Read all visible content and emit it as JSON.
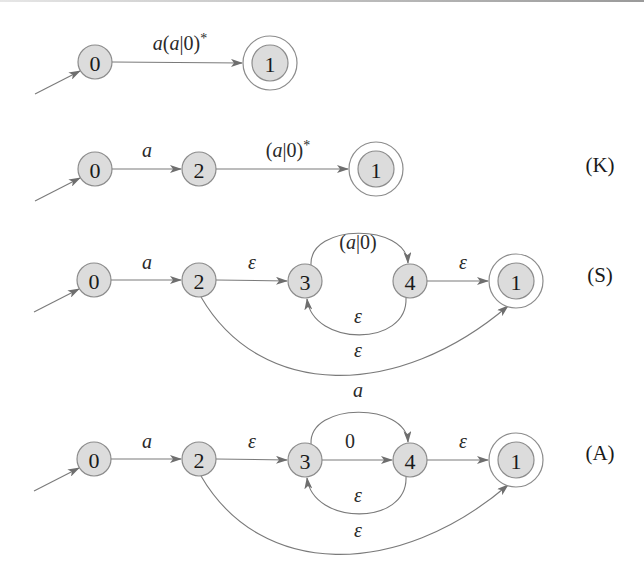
{
  "diagram": {
    "colors": {
      "node_fill": "#dcdcdc",
      "node_stroke": "#8c8c8c",
      "edge": "#7a7a7a",
      "text": "#1a1a1a"
    },
    "rows": [
      {
        "id": "row-initial",
        "tag": "",
        "nodes": [
          {
            "id": "0",
            "label": "0",
            "x": 95,
            "y": 62,
            "accepting": false,
            "initial": true
          },
          {
            "id": "1",
            "label": "1",
            "x": 270,
            "y": 63,
            "accepting": true,
            "initial": false
          }
        ],
        "edges": [
          {
            "from": "0",
            "to": "1",
            "label": "a(a|0)*",
            "label_html": [
              "a",
              "(",
              "a",
              "|0)",
              "*"
            ],
            "type": "straight",
            "lx": 180,
            "ly": 50
          }
        ]
      },
      {
        "id": "row-K",
        "tag": "(K)",
        "tag_x": 600,
        "tag_y": 165,
        "nodes": [
          {
            "id": "0",
            "label": "0",
            "x": 95,
            "y": 169,
            "accepting": false,
            "initial": true
          },
          {
            "id": "2",
            "label": "2",
            "x": 199,
            "y": 169,
            "accepting": false,
            "initial": false
          },
          {
            "id": "1",
            "label": "1",
            "x": 376,
            "y": 169,
            "accepting": true,
            "initial": false
          }
        ],
        "edges": [
          {
            "from": "0",
            "to": "2",
            "label": "a",
            "type": "straight",
            "lx": 147,
            "ly": 157
          },
          {
            "from": "2",
            "to": "1",
            "label": "(a|0)*",
            "type": "straight",
            "lx": 288,
            "ly": 157
          }
        ]
      },
      {
        "id": "row-S",
        "tag": "(S)",
        "tag_x": 600,
        "tag_y": 275,
        "nodes": [
          {
            "id": "0",
            "label": "0",
            "x": 94,
            "y": 280,
            "accepting": false,
            "initial": true
          },
          {
            "id": "2",
            "label": "2",
            "x": 199,
            "y": 280,
            "accepting": false,
            "initial": false
          },
          {
            "id": "3",
            "label": "3",
            "x": 305,
            "y": 281,
            "accepting": false,
            "initial": false
          },
          {
            "id": "4",
            "label": "4",
            "x": 410,
            "y": 281,
            "accepting": false,
            "initial": false
          },
          {
            "id": "1",
            "label": "1",
            "x": 516,
            "y": 281,
            "accepting": true,
            "initial": false
          }
        ],
        "edges": [
          {
            "from": "0",
            "to": "2",
            "label": "a",
            "type": "straight",
            "lx": 147,
            "ly": 269
          },
          {
            "from": "2",
            "to": "3",
            "label": "ε",
            "type": "straight",
            "lx": 252,
            "ly": 269
          },
          {
            "from": "3",
            "to": "4",
            "label": "(a|0)",
            "type": "arc-over",
            "lx": 358,
            "ly": 249
          },
          {
            "from": "4",
            "to": "3",
            "label": "ε",
            "type": "arc-under",
            "lx": 358,
            "ly": 323
          },
          {
            "from": "4",
            "to": "1",
            "label": "ε",
            "type": "straight",
            "lx": 463,
            "ly": 269
          },
          {
            "from": "2",
            "to": "1",
            "label": "ε",
            "type": "arc-big",
            "lx": 358,
            "ly": 357
          }
        ]
      },
      {
        "id": "row-A",
        "tag": "(A)",
        "tag_x": 600,
        "tag_y": 453,
        "nodes": [
          {
            "id": "0",
            "label": "0",
            "x": 94,
            "y": 459,
            "accepting": false,
            "initial": true
          },
          {
            "id": "2",
            "label": "2",
            "x": 199,
            "y": 459,
            "accepting": false,
            "initial": false
          },
          {
            "id": "3",
            "label": "3",
            "x": 305,
            "y": 460,
            "accepting": false,
            "initial": false
          },
          {
            "id": "4",
            "label": "4",
            "x": 410,
            "y": 460,
            "accepting": false,
            "initial": false
          },
          {
            "id": "1",
            "label": "1",
            "x": 516,
            "y": 460,
            "accepting": true,
            "initial": false
          }
        ],
        "edges": [
          {
            "from": "0",
            "to": "2",
            "label": "a",
            "type": "straight",
            "lx": 147,
            "ly": 448
          },
          {
            "from": "2",
            "to": "3",
            "label": "ε",
            "type": "straight",
            "lx": 252,
            "ly": 448
          },
          {
            "from": "3",
            "to": "4",
            "label": "a",
            "type": "arc-over",
            "lx": 358,
            "ly": 397
          },
          {
            "from": "3",
            "to": "4",
            "label": "0",
            "type": "straight",
            "lx": 350,
            "ly": 448
          },
          {
            "from": "4",
            "to": "3",
            "label": "ε",
            "type": "arc-under",
            "lx": 358,
            "ly": 502
          },
          {
            "from": "4",
            "to": "1",
            "label": "ε",
            "type": "straight",
            "lx": 463,
            "ly": 448
          },
          {
            "from": "2",
            "to": "1",
            "label": "ε",
            "type": "arc-big",
            "lx": 358,
            "ly": 537
          }
        ]
      }
    ]
  }
}
